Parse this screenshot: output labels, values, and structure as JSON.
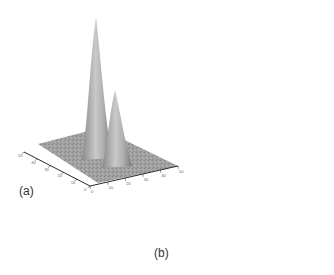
{
  "figure": {
    "panels": [
      {
        "label": "(a)",
        "peaks": [
          {
            "name": "tall-peak",
            "relative_height": 1.0
          },
          {
            "name": "short-peak",
            "relative_height": 0.55
          }
        ],
        "x_ticks": [
          "0",
          "10",
          "20",
          "30",
          "40",
          "50"
        ],
        "y_ticks": [
          "0",
          "10",
          "20",
          "30",
          "40",
          "50"
        ],
        "x_axis_title": "wavelength (nm)",
        "y_axis_title": "wavelength (nm)"
      },
      {
        "label": "(b)",
        "peaks": [
          {
            "name": "short-peak",
            "relative_height": 0.6
          },
          {
            "name": "tall-peak",
            "relative_height": 1.0
          }
        ],
        "x_ticks": [
          "0",
          "10",
          "20",
          "30",
          "40",
          "50"
        ],
        "y_ticks": [
          "0",
          "10",
          "20",
          "30",
          "40",
          "50"
        ],
        "x_axis_title": "wavelength (nm)",
        "y_axis_title": "wavelength (nm)"
      }
    ]
  },
  "chart_data": [
    {
      "type": "surface",
      "title": "(a)",
      "xlabel": "",
      "ylabel": "",
      "zlabel": "",
      "x_ticks": [
        "0",
        "10",
        "20",
        "30",
        "40",
        "50"
      ],
      "y_ticks": [
        "0",
        "10",
        "20",
        "30",
        "40",
        "50"
      ],
      "peaks": [
        {
          "x": 0.35,
          "y": 0.55,
          "height": 1.0,
          "width": 0.06
        },
        {
          "x": 0.55,
          "y": 0.45,
          "height": 0.55,
          "width": 0.07
        }
      ]
    },
    {
      "type": "surface",
      "title": "(b)",
      "xlabel": "",
      "ylabel": "",
      "zlabel": "",
      "x_ticks": [
        "0",
        "10",
        "20",
        "30",
        "40",
        "50"
      ],
      "y_ticks": [
        "0",
        "10",
        "20",
        "30",
        "40",
        "50"
      ],
      "peaks": [
        {
          "x": 0.35,
          "y": 0.6,
          "height": 0.6,
          "width": 0.09
        },
        {
          "x": 0.6,
          "y": 0.4,
          "height": 1.0,
          "width": 0.07
        }
      ]
    }
  ]
}
